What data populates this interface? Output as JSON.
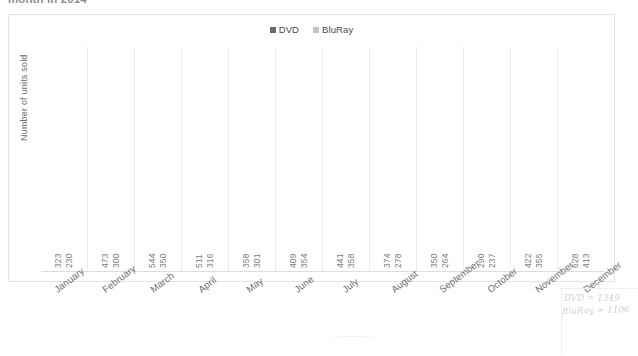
{
  "document": {
    "clipped_title": "month in 2014"
  },
  "annotations": {
    "notes": [
      "DVD = 1349",
      "BluRay = 1106"
    ]
  },
  "chart_data": {
    "type": "bar",
    "title": "month in 2014",
    "xlabel": "",
    "ylabel": "Number of units sold",
    "categories": [
      "January",
      "February",
      "March",
      "April",
      "May",
      "June",
      "July",
      "August",
      "September",
      "October",
      "November",
      "December"
    ],
    "series": [
      {
        "name": "DVD",
        "color": "#6a6a6a",
        "values": [
          323,
          473,
          544,
          511,
          358,
          409,
          441,
          374,
          350,
          290,
          422,
          628
        ]
      },
      {
        "name": "BluRay",
        "color": "#c4c4c4",
        "values": [
          230,
          300,
          350,
          316,
          301,
          354,
          358,
          278,
          264,
          237,
          355,
          413
        ]
      }
    ],
    "ylim": [
      0,
      700
    ],
    "grid": false,
    "gridlines": "vertical-category-separators",
    "legend_position": "top-center",
    "data_labels": true,
    "data_label_orientation": "vertical",
    "xtick_rotation": -37
  }
}
